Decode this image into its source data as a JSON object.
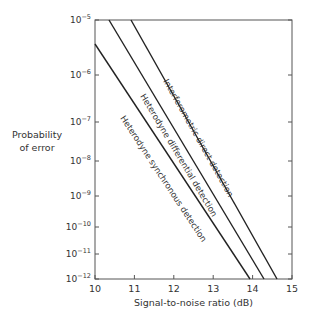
{
  "chart_data": {
    "type": "line",
    "title": "",
    "xlabel": "Signal-to-noise ratio (dB)",
    "ylabel_line1": "Probability",
    "ylabel_line2": "of error",
    "xlim": [
      10,
      15
    ],
    "ylim": [
      1e-12,
      1e-05
    ],
    "x_ticks": [
      "10",
      "11",
      "12",
      "13",
      "14",
      "15"
    ],
    "y_ticks": [
      {
        "base": "10",
        "exp": "−5"
      },
      {
        "base": "10",
        "exp": "−6"
      },
      {
        "base": "10",
        "exp": "−7"
      },
      {
        "base": "10",
        "exp": "−8"
      },
      {
        "base": "10",
        "exp": "−9"
      },
      {
        "base": "10",
        "exp": "−10"
      },
      {
        "base": "10",
        "exp": "−11"
      },
      {
        "base": "10",
        "exp": "−12"
      }
    ],
    "series": [
      {
        "name": "Heterodyne synchronous detection",
        "x": [
          10.0,
          13.9
        ],
        "y": [
          3.5e-06,
          1e-12
        ]
      },
      {
        "name": "Heterodyne differential detection",
        "x": [
          10.35,
          14.3
        ],
        "y": [
          1e-05,
          1e-12
        ]
      },
      {
        "name": "Interferometric direct detection",
        "x": [
          10.9,
          14.65
        ],
        "y": [
          1e-05,
          1e-12
        ]
      }
    ],
    "grid": false,
    "legend": "inline annotations along lines"
  }
}
